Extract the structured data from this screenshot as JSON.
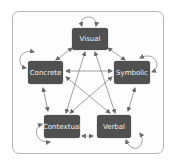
{
  "diagram": {
    "nodes": [
      {
        "id": "visual",
        "label": "Visual"
      },
      {
        "id": "concrete",
        "label": "Concrete"
      },
      {
        "id": "symbolic",
        "label": "Symbolic"
      },
      {
        "id": "contextual",
        "label": "Contextual"
      },
      {
        "id": "verbal",
        "label": "Verbal"
      }
    ],
    "edges": [
      {
        "from": "visual",
        "to": "concrete",
        "type": "bidirectional"
      },
      {
        "from": "visual",
        "to": "symbolic",
        "type": "bidirectional"
      },
      {
        "from": "visual",
        "to": "contextual",
        "type": "bidirectional"
      },
      {
        "from": "visual",
        "to": "verbal",
        "type": "bidirectional"
      },
      {
        "from": "concrete",
        "to": "symbolic",
        "type": "bidirectional"
      },
      {
        "from": "concrete",
        "to": "contextual",
        "type": "bidirectional"
      },
      {
        "from": "concrete",
        "to": "verbal",
        "type": "bidirectional"
      },
      {
        "from": "symbolic",
        "to": "contextual",
        "type": "bidirectional"
      },
      {
        "from": "symbolic",
        "to": "verbal",
        "type": "bidirectional"
      },
      {
        "from": "contextual",
        "to": "verbal",
        "type": "bidirectional-dashed"
      },
      {
        "from": "visual",
        "to": "visual",
        "type": "self-loop"
      },
      {
        "from": "concrete",
        "to": "concrete",
        "type": "self-loop"
      },
      {
        "from": "symbolic",
        "to": "symbolic",
        "type": "self-loop"
      },
      {
        "from": "contextual",
        "to": "contextual",
        "type": "self-loop"
      },
      {
        "from": "verbal",
        "to": "verbal",
        "type": "self-loop"
      }
    ]
  },
  "colors": {
    "node_fill": "#505050",
    "node_text": "#f2f2f2",
    "edge": "#6a6a6a",
    "frame": "#b8b8b8"
  }
}
